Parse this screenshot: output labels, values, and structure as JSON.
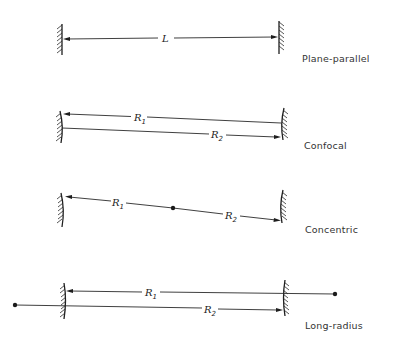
{
  "figure": {
    "configurations": [
      {
        "name": "Plane-parallel",
        "labels": [
          {
            "symbol": "L",
            "subscript": ""
          }
        ]
      },
      {
        "name": "Confocal",
        "labels": [
          {
            "symbol": "R",
            "subscript": "1"
          },
          {
            "symbol": "R",
            "subscript": "2"
          }
        ]
      },
      {
        "name": "Concentric",
        "labels": [
          {
            "symbol": "R",
            "subscript": "1"
          },
          {
            "symbol": "R",
            "subscript": "2"
          }
        ]
      },
      {
        "name": "Long-radius",
        "labels": [
          {
            "symbol": "R",
            "subscript": "1"
          },
          {
            "symbol": "R",
            "subscript": "2"
          }
        ]
      }
    ]
  }
}
